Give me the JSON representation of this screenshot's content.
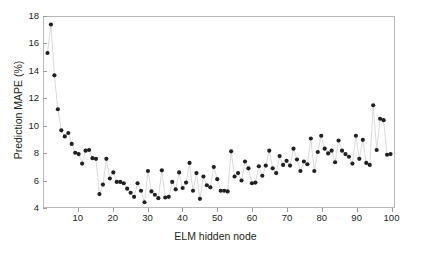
{
  "chart_data": {
    "type": "scatter",
    "title": "",
    "xlabel": "ELM hidden node",
    "ylabel": "Prediction MAPE (%)",
    "xlim": [
      0,
      101
    ],
    "ylim": [
      4,
      18
    ],
    "xticks": [
      10,
      20,
      30,
      40,
      50,
      60,
      70,
      80,
      90,
      100
    ],
    "xtick_labels": [
      "10",
      "20",
      "30",
      "40",
      "50",
      "60",
      "70",
      "80",
      "90",
      "100"
    ],
    "yticks": [
      4,
      6,
      8,
      10,
      12,
      14,
      16,
      18
    ],
    "ytick_labels": [
      "4",
      "6",
      "8",
      "10",
      "12",
      "14",
      "16",
      "18"
    ],
    "grid": false,
    "legend": null,
    "marker": "filled-circle",
    "marker_color": "#231f20",
    "line_color": "#d0d0d0",
    "frame_color": "#b9b9b9",
    "series": [
      {
        "name": "Prediction MAPE",
        "x": [
          1,
          2,
          3,
          4,
          5,
          6,
          7,
          8,
          9,
          10,
          11,
          12,
          13,
          14,
          15,
          16,
          17,
          18,
          19,
          20,
          21,
          22,
          23,
          24,
          25,
          26,
          27,
          28,
          29,
          30,
          31,
          32,
          33,
          34,
          35,
          36,
          37,
          38,
          39,
          40,
          41,
          42,
          43,
          44,
          45,
          46,
          47,
          48,
          49,
          50,
          51,
          52,
          53,
          54,
          55,
          56,
          57,
          58,
          59,
          60,
          61,
          62,
          63,
          64,
          65,
          66,
          67,
          68,
          69,
          70,
          71,
          72,
          73,
          74,
          75,
          76,
          77,
          78,
          79,
          80,
          81,
          82,
          83,
          84,
          85,
          86,
          87,
          88,
          89,
          90,
          91,
          92,
          93,
          94,
          95,
          96,
          97,
          98,
          99,
          100
        ],
        "values": [
          15.35,
          17.45,
          13.7,
          11.2,
          9.65,
          9.2,
          9.45,
          8.65,
          8.0,
          7.9,
          7.2,
          8.15,
          8.2,
          7.6,
          7.55,
          4.95,
          5.65,
          7.55,
          6.1,
          6.55,
          5.85,
          5.85,
          5.75,
          5.35,
          5.05,
          4.75,
          5.75,
          5.2,
          4.35,
          6.65,
          5.15,
          4.9,
          4.65,
          6.7,
          4.7,
          4.75,
          5.85,
          5.3,
          6.55,
          5.4,
          5.8,
          7.25,
          5.2,
          6.5,
          4.6,
          6.25,
          5.6,
          5.45,
          6.95,
          6.05,
          5.2,
          5.2,
          5.15,
          8.1,
          6.25,
          6.5,
          5.95,
          7.35,
          6.85,
          5.75,
          5.8,
          7.0,
          6.3,
          7.05,
          8.15,
          6.85,
          6.5,
          7.75,
          7.1,
          7.4,
          7.05,
          8.3,
          7.5,
          6.65,
          7.35,
          7.15,
          9.05,
          6.65,
          8.05,
          9.25,
          8.3,
          7.95,
          8.15,
          7.3,
          8.9,
          8.15,
          7.9,
          7.7,
          7.2,
          9.25,
          7.55,
          8.95,
          7.25,
          7.1,
          11.5,
          8.2,
          10.5,
          10.4,
          7.85,
          7.9
        ]
      }
    ]
  }
}
